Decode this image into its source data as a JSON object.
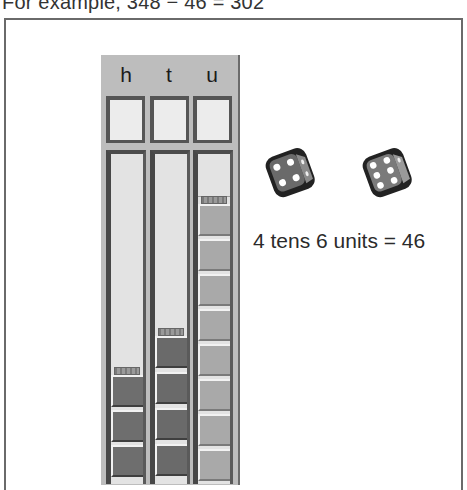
{
  "caption": "For example, 348 − 46 = 302",
  "abacus": {
    "columns": [
      {
        "key": "h",
        "label": "h",
        "name": "hundreds",
        "blocks": 3
      },
      {
        "key": "t",
        "label": "t",
        "name": "tens",
        "blocks": 4
      },
      {
        "key": "u",
        "label": "u",
        "name": "units",
        "blocks": 8
      }
    ]
  },
  "dice": [
    {
      "name": "tens-die",
      "face_value": 4
    },
    {
      "name": "units-die",
      "face_value": 6
    }
  ],
  "expression": {
    "text": "4 tens 6 units  = 46",
    "tens": 4,
    "units": 6,
    "total": 46
  },
  "colors": {
    "frame": "#6a6a6a",
    "panel": "#bdbdbd",
    "tube_bg": "#e3e3e3",
    "block_dark": "#6e6e6e",
    "block_light": "#a9a9a9"
  }
}
